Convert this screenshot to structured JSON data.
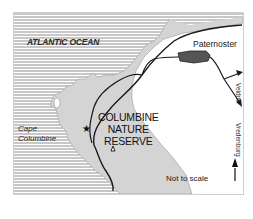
{
  "map": {
    "title": "Columbine Nature Reserve location map",
    "labels": {
      "ocean": "ATLANTIC OCEAN",
      "town": "Paternoster",
      "cape": [
        "Cape",
        "Columbine"
      ],
      "reserve": [
        "COLUMBINE",
        "NATURE",
        "RESERVE"
      ],
      "road_1": "Veldrif",
      "road_2": "Vredenburg",
      "scale_note": "Not to scale",
      "north": "N"
    },
    "symbols": {
      "star": "lighthouse/point-of-interest-star",
      "triangle": "campsite-triangle"
    },
    "colors": {
      "ocean_hatch": "#9a9a9a",
      "land_reserve": "#d4d4d4",
      "land_outside": "#ffffff",
      "roads": "#1a1a1a",
      "town": "#555555",
      "frame": "#cfcfcf"
    }
  }
}
